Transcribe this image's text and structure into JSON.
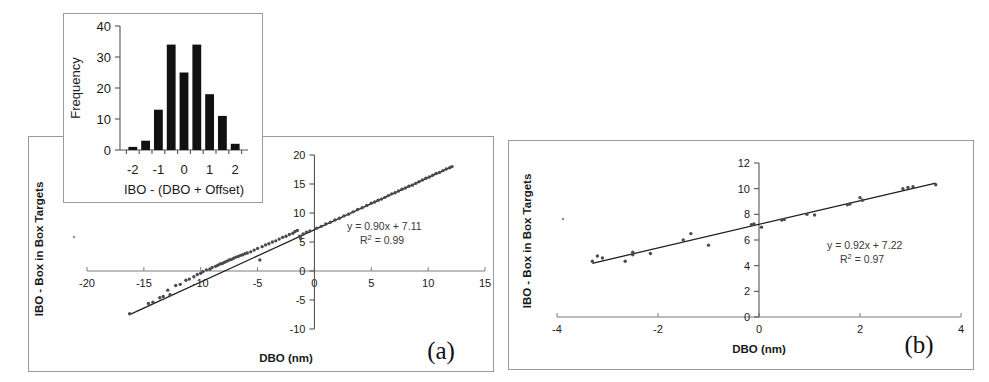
{
  "figure": {
    "panels": [
      {
        "id": "a",
        "letter": "(a)",
        "y_axis_title": "IBO - Box in Box Targets",
        "x_axis_title": "DBO (nm)",
        "equation": "y = 0.90x + 7.11",
        "r_squared_prefix": "R",
        "r_squared_sup": "2",
        "r_squared_value": " = 0.99"
      },
      {
        "id": "b",
        "letter": "(b)",
        "y_axis_title": "IBO - Box in Box Targets",
        "x_axis_title": "DBO (nm)",
        "equation": "y = 0.92x + 7.22",
        "r_squared_prefix": "R",
        "r_squared_sup": "2",
        "r_squared_value": " = 0.97"
      }
    ],
    "inset": {
      "y_axis_title": "Frequency",
      "x_axis_title": "IBO - (DBO + Offset)"
    }
  },
  "chart_data": [
    {
      "id": "panel-a-scatter",
      "type": "scatter",
      "title": "",
      "xlabel": "DBO (nm)",
      "ylabel": "IBO - Box in Box Targets",
      "xlim": [
        -20,
        15
      ],
      "ylim": [
        -10,
        20
      ],
      "xticks": [
        -20,
        -15,
        -10,
        -5,
        0,
        5,
        10,
        15
      ],
      "xticklabels": [
        "-20",
        "-15",
        "-10",
        "-5",
        "0",
        "5",
        "10",
        "15"
      ],
      "yticks": [
        -10,
        -5,
        0,
        5,
        10,
        15,
        20
      ],
      "yticklabels": [
        "-10",
        "-5",
        "0",
        "5",
        "10",
        "15",
        "20"
      ],
      "grid": false,
      "legend": null,
      "annotations": [
        "y = 0.90x + 7.11",
        "R2 = 0.99"
      ],
      "fit": {
        "slope": 0.9,
        "intercept": 7.11,
        "r_squared": 0.99,
        "x_start": -16.3,
        "x_end": 12.1
      },
      "points": [
        [
          -16.25,
          -7.35
        ],
        [
          -14.6,
          -5.6
        ],
        [
          -14.2,
          -5.4
        ],
        [
          -13.6,
          -4.6
        ],
        [
          -13.3,
          -4.4
        ],
        [
          -12.9,
          -3.3
        ],
        [
          -12.7,
          -4.1
        ],
        [
          -12.2,
          -2.5
        ],
        [
          -11.8,
          -2.3
        ],
        [
          -11.3,
          -1.6
        ],
        [
          -11.0,
          -1.4
        ],
        [
          -10.6,
          -1.0
        ],
        [
          -10.3,
          -0.6
        ],
        [
          -10.0,
          -0.4
        ],
        [
          -9.8,
          -0.1
        ],
        [
          -9.5,
          0.2
        ],
        [
          -9.2,
          0.3
        ],
        [
          -9.0,
          0.6
        ],
        [
          -8.7,
          0.8
        ],
        [
          -8.5,
          1.0
        ],
        [
          -8.3,
          1.2
        ],
        [
          -8.1,
          1.3
        ],
        [
          -7.9,
          1.5
        ],
        [
          -7.7,
          1.7
        ],
        [
          -7.5,
          1.9
        ],
        [
          -7.3,
          2.0
        ],
        [
          -7.1,
          2.2
        ],
        [
          -6.9,
          2.4
        ],
        [
          -6.7,
          2.5
        ],
        [
          -6.5,
          2.7
        ],
        [
          -6.3,
          2.8
        ],
        [
          -6.1,
          3.0
        ],
        [
          -5.9,
          3.1
        ],
        [
          -5.6,
          3.3
        ],
        [
          -5.3,
          3.6
        ],
        [
          -5.0,
          3.9
        ],
        [
          -4.8,
          1.9
        ],
        [
          -4.6,
          4.2
        ],
        [
          -4.3,
          4.5
        ],
        [
          -4.0,
          4.7
        ],
        [
          -3.7,
          5.0
        ],
        [
          -3.4,
          5.2
        ],
        [
          -3.1,
          5.5
        ],
        [
          -2.8,
          5.8
        ],
        [
          -2.5,
          6.0
        ],
        [
          -2.2,
          6.3
        ],
        [
          -1.9,
          6.5
        ],
        [
          -1.7,
          6.8
        ],
        [
          -1.5,
          7.0
        ],
        [
          -1.3,
          6.0
        ],
        [
          -1.2,
          5.6
        ],
        [
          -1.0,
          6.4
        ],
        [
          -0.7,
          6.7
        ],
        [
          -0.4,
          6.9
        ],
        [
          0.2,
          7.4
        ],
        [
          0.6,
          7.7
        ],
        [
          1.0,
          8.1
        ],
        [
          1.4,
          8.4
        ],
        [
          1.8,
          8.8
        ],
        [
          2.2,
          9.1
        ],
        [
          2.6,
          9.5
        ],
        [
          3.0,
          9.8
        ],
        [
          3.4,
          10.2
        ],
        [
          3.8,
          10.6
        ],
        [
          4.2,
          10.9
        ],
        [
          4.6,
          11.3
        ],
        [
          5.0,
          11.7
        ],
        [
          5.3,
          11.9
        ],
        [
          5.6,
          12.2
        ],
        [
          5.9,
          12.4
        ],
        [
          6.2,
          12.7
        ],
        [
          6.5,
          13.0
        ],
        [
          6.8,
          13.3
        ],
        [
          7.1,
          13.5
        ],
        [
          7.4,
          13.8
        ],
        [
          7.7,
          14.1
        ],
        [
          8.0,
          14.3
        ],
        [
          8.3,
          14.6
        ],
        [
          8.6,
          14.8
        ],
        [
          8.9,
          15.1
        ],
        [
          9.2,
          15.4
        ],
        [
          9.5,
          15.7
        ],
        [
          9.8,
          16.0
        ],
        [
          10.1,
          16.2
        ],
        [
          10.4,
          16.5
        ],
        [
          10.7,
          16.8
        ],
        [
          11.0,
          17.0
        ],
        [
          11.3,
          17.3
        ],
        [
          11.6,
          17.6
        ],
        [
          11.9,
          17.8
        ],
        [
          12.1,
          18.0
        ]
      ]
    },
    {
      "id": "panel-b-scatter",
      "type": "scatter",
      "title": "",
      "xlabel": "DBO (nm)",
      "ylabel": "IBO - Box in Box Targets",
      "xlim": [
        -4,
        4
      ],
      "ylim": [
        0,
        12
      ],
      "xticks": [
        -4,
        -2,
        0,
        2,
        4
      ],
      "xticklabels": [
        "-4",
        "-2",
        "0",
        "2",
        "4"
      ],
      "yticks": [
        0,
        2,
        4,
        6,
        8,
        10,
        12
      ],
      "yticklabels": [
        "0",
        "2",
        "4",
        "6",
        "8",
        "10",
        "12"
      ],
      "grid": false,
      "legend": null,
      "annotations": [
        "y = 0.92x + 7.22",
        "R2 = 0.97"
      ],
      "fit": {
        "slope": 0.92,
        "intercept": 7.22,
        "r_squared": 0.97,
        "x_start": -3.3,
        "x_end": 3.5
      },
      "points": [
        [
          -3.3,
          4.35
        ],
        [
          -3.2,
          4.75
        ],
        [
          -3.1,
          4.6
        ],
        [
          -2.65,
          4.35
        ],
        [
          -2.5,
          5.05
        ],
        [
          -2.5,
          4.85
        ],
        [
          -2.15,
          4.95
        ],
        [
          -1.5,
          6.0
        ],
        [
          -1.35,
          6.5
        ],
        [
          -1.0,
          5.6
        ],
        [
          -0.15,
          7.2
        ],
        [
          -0.1,
          7.25
        ],
        [
          0.05,
          7.0
        ],
        [
          0.45,
          7.55
        ],
        [
          0.5,
          7.6
        ],
        [
          0.95,
          8.0
        ],
        [
          1.1,
          7.95
        ],
        [
          1.75,
          8.75
        ],
        [
          1.8,
          8.8
        ],
        [
          2.0,
          9.3
        ],
        [
          2.05,
          9.1
        ],
        [
          2.85,
          10.0
        ],
        [
          2.95,
          10.1
        ],
        [
          3.05,
          10.15
        ],
        [
          3.5,
          10.3
        ]
      ]
    },
    {
      "id": "inset-histogram",
      "type": "bar",
      "title": "",
      "xlabel": "IBO - (DBO + Offset)",
      "ylabel": "Frequency",
      "xlim": [
        -2.5,
        2.5
      ],
      "ylim": [
        0,
        40
      ],
      "xticks": [
        -2,
        -1,
        0,
        1,
        2
      ],
      "xticklabels": [
        "-2",
        "-1",
        "0",
        "1",
        "2"
      ],
      "yticks": [
        0,
        10,
        20,
        30,
        40
      ],
      "yticklabels": [
        "0",
        "10",
        "20",
        "30",
        "40"
      ],
      "grid": false,
      "legend": null,
      "categories": [
        "-2.0",
        "-1.5",
        "-1.0",
        "-0.5",
        "0.0",
        "0.5",
        "1.0",
        "1.5",
        "2.0"
      ],
      "bin_centers": [
        -2.0,
        -1.5,
        -1.0,
        -0.5,
        0.0,
        0.5,
        1.0,
        1.5,
        2.0
      ],
      "values": [
        1,
        3,
        13,
        34,
        25,
        34,
        18,
        11,
        2
      ]
    }
  ]
}
